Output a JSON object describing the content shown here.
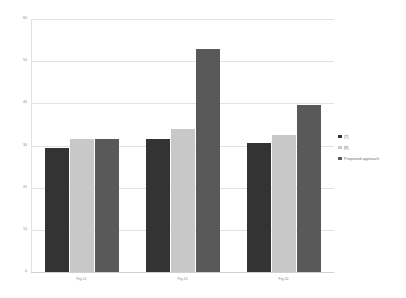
{
  "chart_data": {
    "type": "bar",
    "title": "",
    "subtitle": "",
    "xlabel": "",
    "ylabel": "",
    "categories": [
      "Fig.12",
      "Fig.13",
      "Fig.14"
    ],
    "series": [
      {
        "name": "[7]",
        "color": "#333333",
        "values": [
          29.5,
          31.5,
          30.5
        ]
      },
      {
        "name": "[8]",
        "color": "#c8c8c8",
        "values": [
          31.5,
          34.0,
          32.5
        ]
      },
      {
        "name": "Proposed approach",
        "color": "#595959",
        "values": [
          31.5,
          53.0,
          39.5
        ]
      }
    ],
    "ylim": [
      0,
      60
    ],
    "yticks": [
      0,
      10,
      20,
      30,
      40,
      50,
      60
    ],
    "ytick_labels": [
      "0",
      "10",
      "20",
      "30",
      "40",
      "50",
      "60"
    ],
    "grid": true,
    "grid_color": "#e2e2e2",
    "legend_position": "right",
    "background": "#ffffff"
  }
}
